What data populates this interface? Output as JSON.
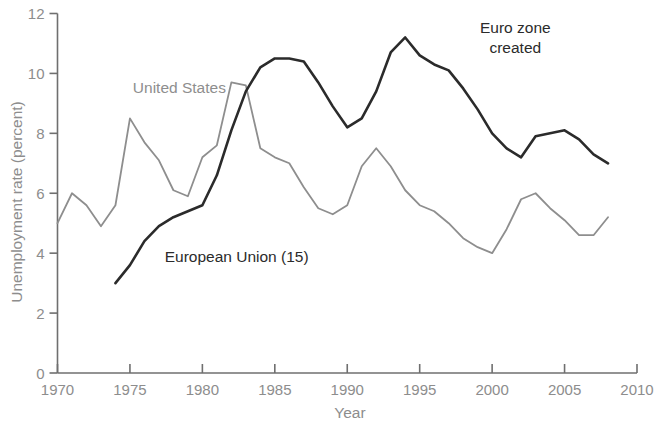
{
  "chart_data": {
    "type": "line",
    "title": "",
    "xlabel": "Year",
    "ylabel": "Unemployment rate (percent)",
    "xlim": [
      1970,
      2010
    ],
    "ylim": [
      0,
      12
    ],
    "xticks": [
      1970,
      1975,
      1980,
      1985,
      1990,
      1995,
      2000,
      2005,
      2010
    ],
    "yticks": [
      0,
      2,
      4,
      6,
      8,
      10,
      12
    ],
    "grid": false,
    "legend_position": "inline-labels",
    "series": [
      {
        "name": "United States",
        "color": "#8e8e8e",
        "label_x": 1975.2,
        "label_y": 9.35,
        "x": [
          1970,
          1971,
          1972,
          1973,
          1974,
          1975,
          1976,
          1977,
          1978,
          1979,
          1980,
          1981,
          1982,
          1983,
          1984,
          1985,
          1986,
          1987,
          1988,
          1989,
          1990,
          1991,
          1992,
          1993,
          1994,
          1995,
          1996,
          1997,
          1998,
          1999,
          2000,
          2001,
          2002,
          2003,
          2004,
          2005,
          2006,
          2007,
          2008
        ],
        "values": [
          5.0,
          6.0,
          5.6,
          4.9,
          5.6,
          8.5,
          7.7,
          7.1,
          6.1,
          5.9,
          7.2,
          7.6,
          9.7,
          9.6,
          7.5,
          7.2,
          7.0,
          6.2,
          5.5,
          5.3,
          5.6,
          6.9,
          7.5,
          6.9,
          6.1,
          5.6,
          5.4,
          5.0,
          4.5,
          4.2,
          4.0,
          4.8,
          5.8,
          6.0,
          5.5,
          5.1,
          4.6,
          4.6,
          5.2
        ]
      },
      {
        "name": "European Union (15)",
        "color": "#2b2b2b",
        "label_x": 1977.4,
        "label_y": 3.7,
        "x": [
          1974,
          1975,
          1976,
          1977,
          1978,
          1979,
          1980,
          1981,
          1982,
          1983,
          1984,
          1985,
          1986,
          1987,
          1988,
          1989,
          1990,
          1991,
          1992,
          1993,
          1994,
          1995,
          1996,
          1997,
          1998,
          1999,
          2000,
          2001,
          2002,
          2003,
          2004,
          2005,
          2006,
          2007,
          2008
        ],
        "values": [
          3.0,
          3.6,
          4.4,
          4.9,
          5.2,
          5.4,
          5.6,
          6.6,
          8.1,
          9.4,
          10.2,
          10.5,
          10.5,
          10.4,
          9.7,
          8.9,
          8.2,
          8.5,
          9.4,
          10.7,
          11.2,
          10.6,
          10.3,
          10.1,
          9.5,
          8.8,
          8.0,
          7.5,
          7.2,
          7.9,
          8.0,
          8.1,
          7.8,
          7.3,
          7.0
        ]
      }
    ],
    "annotations": [
      {
        "name": "euro-zone-created",
        "lines": [
          "Euro zone",
          "created"
        ],
        "x": 2001.6,
        "y": 11.35
      }
    ]
  }
}
